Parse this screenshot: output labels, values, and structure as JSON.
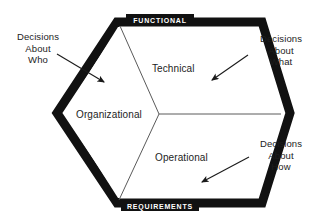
{
  "figure": {
    "shape": "hexagon",
    "background_color": "#ffffff",
    "border_color": "#111111",
    "divider_color": "#555555",
    "text_color": "#1d1d1d",
    "edge_label_text_color": "#ffffff"
  },
  "edge_labels": {
    "top": "FUNCTIONAL",
    "bottom": "REQUIREMENTS"
  },
  "segments": [
    {
      "id": "technical",
      "label": "Technical"
    },
    {
      "id": "organizational",
      "label": "Organizational"
    },
    {
      "id": "operational",
      "label": "Operational"
    }
  ],
  "annotations": [
    {
      "id": "who",
      "lines": [
        "Decisions",
        "About",
        "Who"
      ],
      "line1": "Decisions",
      "line2": "About",
      "line3": "Who",
      "points_to": "organizational"
    },
    {
      "id": "what",
      "lines": [
        "Decisions",
        "About",
        "What"
      ],
      "line1": "Decisions",
      "line2": "About",
      "line3": "What",
      "points_to": "technical"
    },
    {
      "id": "how",
      "lines": [
        "Decisions",
        "About",
        "How"
      ],
      "line1": "Decisions",
      "line2": "About",
      "line3": "How",
      "points_to": "operational"
    }
  ]
}
